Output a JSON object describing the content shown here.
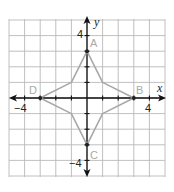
{
  "figure": {
    "x_axis_label": "x",
    "y_axis_label": "y",
    "tick_labels": {
      "x_neg": "−4",
      "x_pos": "4",
      "y_pos": "4",
      "y_neg": "−4"
    },
    "points": [
      {
        "name": "A",
        "x": 0,
        "y": 3
      },
      {
        "name": "B",
        "x": 3,
        "y": 0
      },
      {
        "name": "C",
        "x": 0,
        "y": -3
      },
      {
        "name": "D",
        "x": -3,
        "y": 0
      }
    ],
    "polygon": [
      [
        0,
        3
      ],
      [
        1,
        1
      ],
      [
        3,
        0
      ],
      [
        1,
        -1
      ],
      [
        0,
        -3
      ],
      [
        -1,
        -1
      ],
      [
        -3,
        0
      ],
      [
        -1,
        1
      ]
    ],
    "grid": {
      "x_range": [
        -5,
        5
      ],
      "y_range": [
        -5,
        5
      ],
      "unit_px": 15.6
    },
    "colors": {
      "grid": "#b9b9b9",
      "axis": "#111111",
      "shape": "#a8a8a8",
      "point_label": "#a9a9a9"
    }
  }
}
